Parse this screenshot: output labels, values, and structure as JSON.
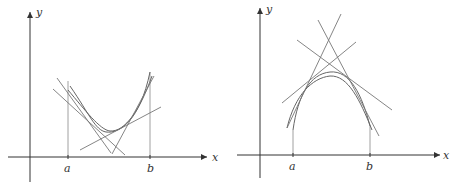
{
  "figures": [
    {
      "id": "left",
      "description": "Concave upward curve with tangent lines lying below the curve",
      "labels": {
        "x_axis": "x",
        "y_axis": "y",
        "a": "a",
        "b": "b"
      }
    },
    {
      "id": "right",
      "description": "Concave downward curve with tangent lines lying above the curve",
      "labels": {
        "x_axis": "x",
        "y_axis": "y",
        "a": "a",
        "b": "b"
      }
    }
  ],
  "colors": {
    "axis": "#333333",
    "curve": "#666666",
    "tangent": "#777777"
  }
}
